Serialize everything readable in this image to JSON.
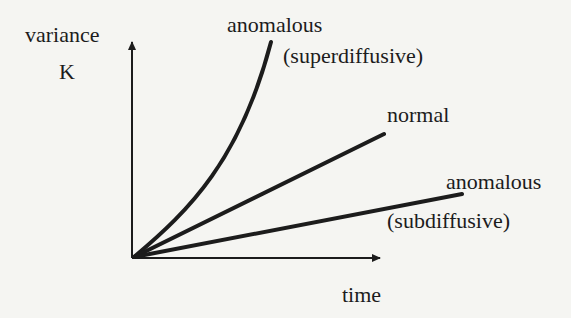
{
  "diagram": {
    "title": "",
    "y_axis": {
      "label": "variance",
      "symbol": "K"
    },
    "x_axis": {
      "label": "time"
    },
    "curves": [
      {
        "id": "superdiffusive",
        "label_line1": "anomalous",
        "label_line2": "(superdiffusive)",
        "shape": "convex curve"
      },
      {
        "id": "normal",
        "label_line1": "normal",
        "shape": "straight line"
      },
      {
        "id": "subdiffusive",
        "label_line1": "anomalous",
        "label_line2": "(subdiffusive)",
        "shape": "shallow line"
      }
    ],
    "colors": {
      "ink": "#1c1c1c",
      "background": "#f5f5f2"
    }
  }
}
